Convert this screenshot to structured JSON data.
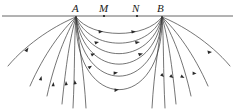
{
  "figure": {
    "title": "",
    "background_color": "#ffffff",
    "line_color": "#3a3a3a",
    "surface_line_color": "#555555",
    "label_color": "#1a1a1a",
    "width": 235,
    "height": 112
  },
  "surface": {
    "name": "ground-surface-line",
    "y": 16,
    "x_start": 2,
    "x_end": 233
  },
  "electrodes": [
    {
      "id": "A",
      "label": "A",
      "role": "current-electrode",
      "x": 76,
      "y": 16,
      "label_x": 72,
      "label_y": 3,
      "marker": "none"
    },
    {
      "id": "M",
      "label": "M",
      "role": "potential-electrode",
      "x": 104,
      "y": 16,
      "label_x": 99,
      "label_y": 3,
      "marker": "dot"
    },
    {
      "id": "N",
      "label": "N",
      "role": "potential-electrode",
      "x": 137,
      "y": 16,
      "label_x": 132,
      "label_y": 3,
      "marker": "dot"
    },
    {
      "id": "B",
      "label": "B",
      "role": "current-electrode",
      "x": 162,
      "y": 16,
      "label_x": 157,
      "label_y": 3,
      "marker": "none"
    }
  ],
  "flow_lines": {
    "description": "current-flow-lines",
    "arc_count": 6,
    "outer_count": 12,
    "arrow_direction_interior": "A-to-B",
    "arrow_direction_left_exterior": "toward-A",
    "arrow_direction_right_exterior": "away-from-B",
    "arcs": [
      {
        "depth": 22
      },
      {
        "depth": 33
      },
      {
        "depth": 45
      },
      {
        "depth": 58
      },
      {
        "depth": 72
      },
      {
        "depth": 90
      }
    ]
  }
}
